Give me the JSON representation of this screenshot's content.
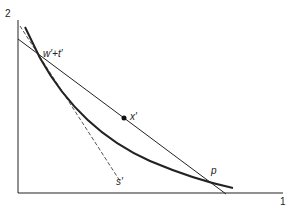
{
  "axes": {
    "x_label": "1",
    "y_label": "2"
  },
  "labels": {
    "intersection": "w′+t′",
    "point_x": "x′",
    "dashed_line": "s′",
    "point_p": "p"
  },
  "colors": {
    "ink": "#222222",
    "dashed": "#555555",
    "background": "#ffffff"
  }
}
